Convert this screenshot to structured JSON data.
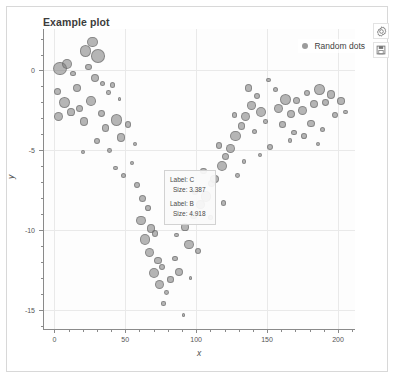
{
  "widget": {
    "title": "Example plot"
  },
  "toolbar": {
    "settings_icon": "gear-icon",
    "save_icon": "save-icon"
  },
  "legend": {
    "position": "top-right",
    "entries": [
      {
        "label": "Random dots",
        "color": "#7a7a7a",
        "marker": "circle"
      }
    ]
  },
  "tooltip": {
    "entries": [
      {
        "label_line": "Label: C",
        "size_line": "Size: 3.387"
      },
      {
        "label_line": "Label: B",
        "size_line": "Size: 4.918"
      }
    ]
  },
  "chart_data": {
    "type": "scatter",
    "title": "Example plot",
    "xlabel": "x",
    "ylabel": "y",
    "xlim": [
      -8,
      212
    ],
    "ylim": [
      -16.2,
      2.6
    ],
    "xticks": [
      0,
      50,
      100,
      150,
      200
    ],
    "yticks": [
      0,
      -5,
      -10,
      -15
    ],
    "grid": true,
    "legend_position": "top-right",
    "series": [
      {
        "name": "Random dots",
        "color": "#7a7a7a",
        "opacity": 0.55,
        "size_encoding": "radius",
        "points": [
          {
            "x": 4,
            "y": 0.1,
            "s": 5.6
          },
          {
            "x": 9,
            "y": 0.4,
            "s": 4.2
          },
          {
            "x": 2,
            "y": -1.3,
            "s": 3.1
          },
          {
            "x": 13,
            "y": -0.2,
            "s": 2.4
          },
          {
            "x": 16,
            "y": -1.1,
            "s": 3.6
          },
          {
            "x": 7,
            "y": -2.0,
            "s": 4.6
          },
          {
            "x": 12,
            "y": -2.6,
            "s": 3.3
          },
          {
            "x": 3,
            "y": -2.9,
            "s": 3.9
          },
          {
            "x": 18,
            "y": -2.4,
            "s": 3.0
          },
          {
            "x": 22,
            "y": 1.2,
            "s": 5.0
          },
          {
            "x": 27,
            "y": 1.8,
            "s": 4.4
          },
          {
            "x": 31,
            "y": 0.9,
            "s": 5.8
          },
          {
            "x": 24,
            "y": 0.2,
            "s": 2.7
          },
          {
            "x": 29,
            "y": -0.5,
            "s": 3.4
          },
          {
            "x": 34,
            "y": -0.8,
            "s": 2.2
          },
          {
            "x": 26,
            "y": -1.9,
            "s": 4.1
          },
          {
            "x": 21,
            "y": -3.2,
            "s": 3.7
          },
          {
            "x": 33,
            "y": -2.7,
            "s": 2.9
          },
          {
            "x": 38,
            "y": -1.4,
            "s": 2.0
          },
          {
            "x": 41,
            "y": -0.9,
            "s": 2.3
          },
          {
            "x": 36,
            "y": -3.6,
            "s": 3.2
          },
          {
            "x": 44,
            "y": -3.1,
            "s": 4.8
          },
          {
            "x": 30,
            "y": -4.4,
            "s": 2.6
          },
          {
            "x": 39,
            "y": -5.0,
            "s": 2.1
          },
          {
            "x": 47,
            "y": -4.2,
            "s": 3.5
          },
          {
            "x": 52,
            "y": -3.4,
            "s": 2.8
          },
          {
            "x": 43,
            "y": -6.1,
            "s": 1.9
          },
          {
            "x": 49,
            "y": -6.6,
            "s": 2.2
          },
          {
            "x": 55,
            "y": -5.8,
            "s": 1.7
          },
          {
            "x": 58,
            "y": -7.2,
            "s": 2.5
          },
          {
            "x": 62,
            "y": -8.0,
            "s": 3.0
          },
          {
            "x": 66,
            "y": -8.6,
            "s": 2.4
          },
          {
            "x": 61,
            "y": -9.4,
            "s": 4.0
          },
          {
            "x": 68,
            "y": -9.9,
            "s": 3.6
          },
          {
            "x": 64,
            "y": -10.6,
            "s": 4.5
          },
          {
            "x": 71,
            "y": -10.2,
            "s": 2.9
          },
          {
            "x": 67,
            "y": -11.4,
            "s": 3.8
          },
          {
            "x": 73,
            "y": -11.9,
            "s": 3.2
          },
          {
            "x": 70,
            "y": -12.7,
            "s": 4.3
          },
          {
            "x": 76,
            "y": -12.3,
            "s": 2.6
          },
          {
            "x": 74,
            "y": -13.4,
            "s": 3.9
          },
          {
            "x": 79,
            "y": -13.9,
            "s": 2.1
          },
          {
            "x": 77,
            "y": -14.6,
            "s": 1.8
          },
          {
            "x": 82,
            "y": -13.1,
            "s": 2.7
          },
          {
            "x": 88,
            "y": -12.6,
            "s": 3.4
          },
          {
            "x": 85,
            "y": -11.8,
            "s": 2.3
          },
          {
            "x": 91,
            "y": -15.3,
            "s": 1.6
          },
          {
            "x": 95,
            "y": -10.9,
            "s": 4.1
          },
          {
            "x": 92,
            "y": -9.8,
            "s": 3.3
          },
          {
            "x": 98,
            "y": -9.1,
            "s": 2.8
          },
          {
            "x": 103,
            "y": -8.4,
            "s": 3.7
          },
          {
            "x": 99,
            "y": -7.6,
            "s": 2.5
          },
          {
            "x": 107,
            "y": -7.9,
            "s": 4.4
          },
          {
            "x": 111,
            "y": -7.1,
            "s": 3.1
          },
          {
            "x": 105,
            "y": -6.3,
            "s": 2.9
          },
          {
            "x": 113,
            "y": -6.8,
            "s": 3.5
          },
          {
            "x": 118,
            "y": -6.0,
            "s": 4.2
          },
          {
            "x": 121,
            "y": -5.4,
            "s": 3.0
          },
          {
            "x": 116,
            "y": -4.7,
            "s": 2.6
          },
          {
            "x": 124,
            "y": -4.9,
            "s": 3.8
          },
          {
            "x": 128,
            "y": -4.1,
            "s": 4.6
          },
          {
            "x": 132,
            "y": -3.5,
            "s": 3.3
          },
          {
            "x": 127,
            "y": -2.8,
            "s": 2.4
          },
          {
            "x": 135,
            "y": -2.9,
            "s": 4.0
          },
          {
            "x": 139,
            "y": -2.2,
            "s": 3.6
          },
          {
            "x": 143,
            "y": -1.6,
            "s": 2.7
          },
          {
            "x": 137,
            "y": -1.1,
            "s": 3.2
          },
          {
            "x": 146,
            "y": -2.6,
            "s": 4.3
          },
          {
            "x": 141,
            "y": -3.8,
            "s": 2.2
          },
          {
            "x": 149,
            "y": -3.2,
            "s": 2.0
          },
          {
            "x": 158,
            "y": -2.4,
            "s": 3.9
          },
          {
            "x": 163,
            "y": -1.8,
            "s": 4.7
          },
          {
            "x": 167,
            "y": -2.7,
            "s": 3.4
          },
          {
            "x": 161,
            "y": -3.4,
            "s": 2.8
          },
          {
            "x": 171,
            "y": -1.9,
            "s": 3.0
          },
          {
            "x": 175,
            "y": -2.5,
            "s": 4.1
          },
          {
            "x": 169,
            "y": -3.9,
            "s": 2.3
          },
          {
            "x": 178,
            "y": -1.4,
            "s": 2.6
          },
          {
            "x": 183,
            "y": -2.1,
            "s": 3.7
          },
          {
            "x": 187,
            "y": -1.2,
            "s": 4.4
          },
          {
            "x": 181,
            "y": -3.3,
            "s": 3.1
          },
          {
            "x": 191,
            "y": -2.0,
            "s": 2.9
          },
          {
            "x": 195,
            "y": -1.5,
            "s": 3.5
          },
          {
            "x": 189,
            "y": -3.7,
            "s": 2.2
          },
          {
            "x": 198,
            "y": -2.8,
            "s": 2.5
          },
          {
            "x": 202,
            "y": -1.9,
            "s": 3.2
          },
          {
            "x": 205,
            "y": -2.6,
            "s": 2.1
          },
          {
            "x": 166,
            "y": -4.4,
            "s": 1.9
          },
          {
            "x": 176,
            "y": -4.1,
            "s": 2.4
          },
          {
            "x": 186,
            "y": -4.6,
            "s": 1.7
          },
          {
            "x": 152,
            "y": -4.8,
            "s": 2.8
          },
          {
            "x": 145,
            "y": -5.3,
            "s": 2.0
          },
          {
            "x": 156,
            "y": -1.2,
            "s": 2.3
          },
          {
            "x": 151,
            "y": -0.6,
            "s": 1.8
          },
          {
            "x": 119,
            "y": -8.3,
            "s": 2.2
          },
          {
            "x": 110,
            "y": -9.2,
            "s": 1.9
          },
          {
            "x": 101,
            "y": -11.3,
            "s": 2.5
          },
          {
            "x": 86,
            "y": -10.3,
            "s": 2.0
          },
          {
            "x": 57,
            "y": -4.6,
            "s": 1.8
          },
          {
            "x": 46,
            "y": -1.8,
            "s": 1.6
          },
          {
            "x": 20,
            "y": -5.1,
            "s": 1.7
          },
          {
            "x": 129,
            "y": -6.6,
            "s": 2.1
          },
          {
            "x": 134,
            "y": -5.7,
            "s": 1.8
          },
          {
            "x": 96,
            "y": -13.0,
            "s": 1.6
          }
        ]
      }
    ]
  },
  "axis": {
    "x_tick_labels": [
      "0",
      "50",
      "100",
      "150",
      "200"
    ],
    "y_tick_labels": [
      "0",
      "-5",
      "-10",
      "-15"
    ],
    "xlabel": "x",
    "ylabel": "y"
  },
  "colors": {
    "bubble": "#7a7a7a",
    "grid": "#e9e9e9",
    "axis": "#8a8a8a",
    "frame": "#d8d8d8",
    "text": "#4a4a4a"
  }
}
